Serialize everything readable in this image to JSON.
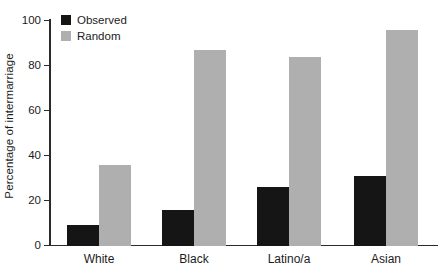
{
  "chart_data": {
    "type": "bar",
    "categories": [
      "White",
      "Black",
      "Latino/a",
      "Asian"
    ],
    "series": [
      {
        "name": "Observed",
        "color": "#151515",
        "values": [
          9,
          16,
          26,
          31
        ]
      },
      {
        "name": "Random",
        "color": "#b0afaf",
        "values": [
          36,
          87,
          84,
          96
        ]
      }
    ],
    "title": "",
    "xlabel": "",
    "ylabel": "Percentage of intermarriage",
    "ylim": [
      0,
      100
    ],
    "yticks": [
      0,
      20,
      40,
      60,
      80,
      100
    ],
    "grid": false,
    "legend_position": "top-left-inside",
    "axis_color": "#2b2b2b"
  }
}
